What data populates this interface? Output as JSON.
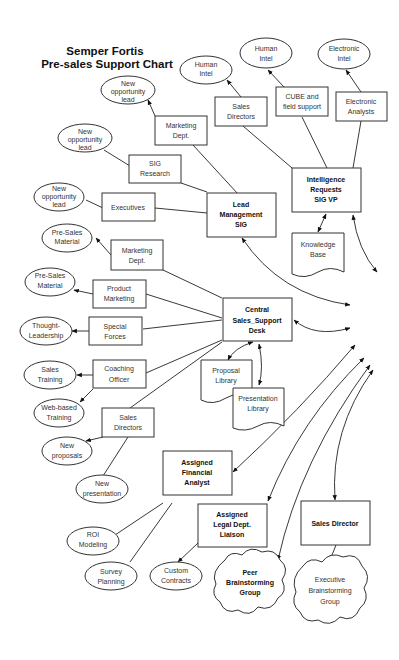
{
  "title": {
    "line1": "Semper Fortis",
    "line2": "Pre-sales Support Chart"
  },
  "hubs": {
    "lead_management": [
      "Lead",
      "Management",
      "SIG"
    ],
    "intelligence_requests": [
      "Intelligence",
      "Requests",
      "SIG VP"
    ],
    "central_desk": [
      "Central",
      "Sales_Support",
      "Desk"
    ],
    "financial_analyst": [
      "Assigned",
      "Financial",
      "Analyst"
    ],
    "legal_liaison": [
      "Assigned",
      "Legal Dept.",
      "Liaison"
    ],
    "sales_director": [
      "Sales Director"
    ]
  },
  "boxes": {
    "marketing_dept_top": [
      "Marketing",
      "Dept."
    ],
    "sig_research": [
      "SIG",
      "Research"
    ],
    "executives": [
      "Executives"
    ],
    "sales_directors_top": [
      "Sales",
      "Directors"
    ],
    "cube_field_support": [
      "CUBE and",
      "field support"
    ],
    "electronic_analysts": [
      "Electronic",
      "Analysts"
    ],
    "marketing_dept_mid": [
      "Marketing",
      "Dept."
    ],
    "product_marketing": [
      "Product",
      "Marketing"
    ],
    "special_forces": [
      "Special",
      "Forces"
    ],
    "coaching_officer": [
      "Coaching",
      "Officer"
    ],
    "sales_directors_bottom": [
      "Sales",
      "Directors"
    ]
  },
  "ellipses": {
    "new_opp_lead_1": [
      "New",
      "opportunity",
      "lead"
    ],
    "new_opp_lead_2": [
      "New",
      "opportunity",
      "lead"
    ],
    "new_opp_lead_3": [
      "New",
      "opportunity",
      "lead"
    ],
    "human_intel_1": [
      "Human",
      "Intel"
    ],
    "human_intel_2": [
      "Human",
      "Intel"
    ],
    "electronic_intel": [
      "Electronic",
      "Intel"
    ],
    "pre_sales_material_1": [
      "Pre-Sales",
      "Material"
    ],
    "pre_sales_material_2": [
      "Pre-Sales",
      "Material"
    ],
    "thought_leadership": [
      "Thought-",
      "Leadership"
    ],
    "sales_training": [
      "Sales",
      "Training"
    ],
    "web_based_training": [
      "Web-based",
      "Training"
    ],
    "new_proposals": [
      "New",
      "proposals"
    ],
    "new_presentation": [
      "New",
      "presentation"
    ],
    "roi_modeling": [
      "ROI",
      "Modeling"
    ],
    "survey_planning": [
      "Survey",
      "Planning"
    ],
    "custom_contracts": [
      "Custom",
      "Contracts"
    ]
  },
  "documents": {
    "knowledge_base": [
      "Knowledge",
      "Base"
    ],
    "proposal_library": [
      "Proposal",
      "Library"
    ],
    "presentation_library": [
      "Presentation",
      "Library"
    ]
  },
  "clouds": {
    "peer_brainstorming": [
      "Peer",
      "Brainstorming",
      "Group"
    ],
    "executive_brainstorming": [
      "Executive",
      "Brainstorming",
      "Group"
    ]
  }
}
